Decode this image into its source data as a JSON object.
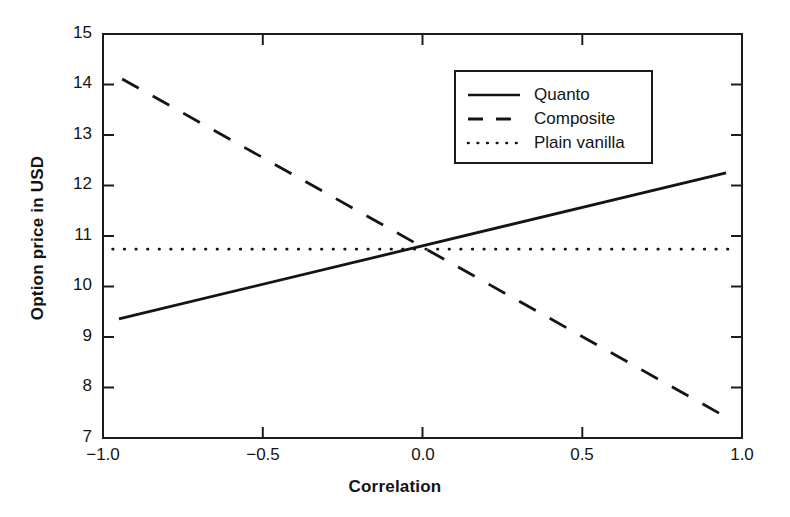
{
  "chart_data": {
    "type": "line",
    "title": "",
    "xlabel": "Correlation",
    "ylabel": "Option price in USD",
    "xlim": [
      -1.0,
      1.0
    ],
    "ylim": [
      7,
      15
    ],
    "xticks": [
      -1.0,
      -0.5,
      0.0,
      0.5,
      1.0
    ],
    "xtick_labels": [
      "−1.0",
      "−0.5",
      "0.0",
      "0.5",
      "1.0"
    ],
    "yticks": [
      7,
      8,
      9,
      10,
      11,
      12,
      13,
      14,
      15
    ],
    "ytick_labels": [
      "7",
      "8",
      "9",
      "10",
      "11",
      "12",
      "13",
      "14",
      "15"
    ],
    "grid": false,
    "legend_position": "upper right",
    "series": [
      {
        "name": "Quanto",
        "style": "solid",
        "color": "#141414",
        "x": [
          -0.95,
          0.95
        ],
        "y": [
          9.36,
          12.25
        ]
      },
      {
        "name": "Composite",
        "style": "dashed",
        "color": "#141414",
        "x": [
          -0.94,
          0.94
        ],
        "y": [
          14.11,
          7.45
        ]
      },
      {
        "name": "Plain vanilla",
        "style": "dotted",
        "color": "#141414",
        "x": [
          -0.97,
          0.97
        ],
        "y": [
          10.74,
          10.74
        ]
      }
    ]
  },
  "axes": {
    "x_title": "Correlation",
    "y_title": "Option price in USD",
    "x_tick_labels": [
      "−1.0",
      "−0.5",
      "0.0",
      "0.5",
      "1.0"
    ],
    "y_tick_labels": [
      "15",
      "14",
      "13",
      "12",
      "11",
      "10",
      "9",
      "8",
      "7"
    ]
  },
  "legend": {
    "entries": [
      {
        "label": "Quanto",
        "style": "solid"
      },
      {
        "label": "Composite",
        "style": "dashed"
      },
      {
        "label": "Plain vanilla",
        "style": "dotted"
      }
    ]
  },
  "colors": {
    "ink": "#141414",
    "background": "#ffffff"
  }
}
